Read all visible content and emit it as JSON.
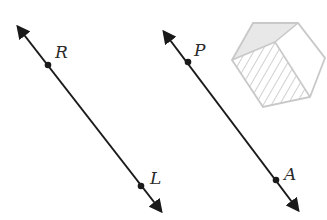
{
  "figure": {
    "lines": [
      {
        "name": "line-RL",
        "start": [
          16,
          24
        ],
        "end": [
          163,
          214
        ],
        "color": "#1a1a1a",
        "points": [
          {
            "label": "R",
            "x": 48,
            "y": 65,
            "label_x": 55,
            "label_y": 58
          },
          {
            "label": "L",
            "x": 141,
            "y": 186,
            "label_x": 150,
            "label_y": 184
          }
        ]
      },
      {
        "name": "line-PA",
        "start": [
          162,
          29
        ],
        "end": [
          300,
          213
        ],
        "color": "#1a1a1a",
        "points": [
          {
            "label": "P",
            "x": 188,
            "y": 62,
            "label_x": 194,
            "label_y": 56
          },
          {
            "label": "A",
            "x": 276,
            "y": 180,
            "label_x": 284,
            "label_y": 180
          }
        ]
      }
    ],
    "hexagon": {
      "stroke": "#c8c8c8",
      "fill_top": "#e6e6e6",
      "hatch_color": "#c4c4c4"
    }
  }
}
